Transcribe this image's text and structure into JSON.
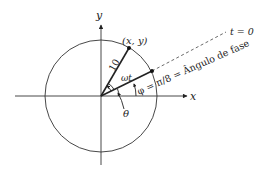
{
  "diagram": {
    "type": "phasor-circle",
    "axes": {
      "x_label": "x",
      "y_label": "y"
    },
    "radius_label": "10",
    "point_label": "(x, y)",
    "omega_t_label": "ωt",
    "phase_label": "φ = π/8 = Ângulo de fase",
    "theta_label": "θ",
    "t0_label": "t = 0",
    "colors": {
      "stroke": "#222222",
      "dashed": "#444444"
    }
  }
}
